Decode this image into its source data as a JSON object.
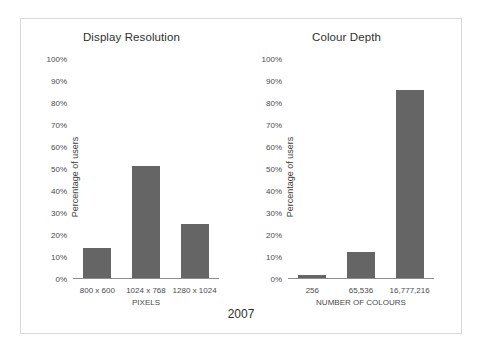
{
  "figure": {
    "year_caption": "2007",
    "bar_color": "#656565",
    "axis_color": "#8d8d8d",
    "frame_color": "#d8d8d8",
    "background": "#ffffff"
  },
  "chart_data": [
    {
      "type": "bar",
      "title": "Display Resolution",
      "categories": [
        "800 x 600",
        "1024 x 768",
        "1280 x 1024"
      ],
      "values": [
        14,
        51.5,
        25
      ],
      "xlabel": "PIXELS",
      "ylabel": "Percentage of users",
      "ylim": [
        0,
        100
      ],
      "yticks": [
        "0%",
        "10%",
        "20%",
        "30%",
        "40%",
        "50%",
        "60%",
        "70%",
        "80%",
        "90%",
        "100%"
      ],
      "ytick_values": [
        0,
        10,
        20,
        30,
        40,
        50,
        60,
        70,
        80,
        90,
        100
      ],
      "grid": false,
      "legend": "none"
    },
    {
      "type": "bar",
      "title": "Colour Depth",
      "categories": [
        "256",
        "65,536",
        "16,777,216"
      ],
      "values": [
        2,
        12.5,
        86
      ],
      "xlabel": "NUMBER OF COLOURS",
      "ylabel": "Percentage of users",
      "ylim": [
        0,
        100
      ],
      "yticks": [
        "0%",
        "10%",
        "20%",
        "30%",
        "40%",
        "50%",
        "60%",
        "70%",
        "80%",
        "90%",
        "100%"
      ],
      "ytick_values": [
        0,
        10,
        20,
        30,
        40,
        50,
        60,
        70,
        80,
        90,
        100
      ],
      "grid": false,
      "legend": "none"
    }
  ]
}
